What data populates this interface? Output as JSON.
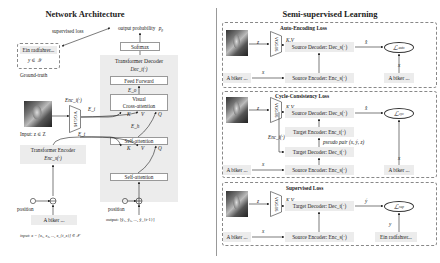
{
  "left_panel": {
    "title": "Network Architecture",
    "supervised_loss": "supervised loss",
    "output_probability": "output probability",
    "output_probability_symbol": "p_θ",
    "ground_truth_box": {
      "text": "Ein radfahrer...",
      "symbol": "y ∈ 𝒴",
      "caption": "Ground-truth"
    },
    "transformer_decoder": {
      "title": "Transformer Decoder",
      "fn": "Dec_t(·)",
      "softmax": "Softmax",
      "feed_forward": "Feed Forward",
      "visual_cross_attention_line1": "Visual",
      "visual_cross_attention_line2": "Cross-attention",
      "self_attention_1": "Self-attention",
      "self_attention_2": "Self-attention",
      "E_o": "E_o",
      "E_h": "E_h",
      "K": "K",
      "V": "V",
      "Q": "Q"
    },
    "image_encoder": {
      "fn": "Enc_i(·)",
      "label": "VGG16",
      "E_i": "E_i"
    },
    "input_image_caption": "Input:  z ∈ Z",
    "E_t": "E_t",
    "transformer_encoder": {
      "title": "Transformer Encoder",
      "fn": "Enc_s(·)"
    },
    "position_left": "position",
    "position_right": "position",
    "input_text_box": "A biker ...",
    "input_formula": "input:   x = [x₁, x₂, ..., x_{t_x}] ∈ 𝒳",
    "output_formula": "output:  [ỹ₁, ỹ₂, ..., ỹ_{t-1}]"
  },
  "right_panel": {
    "title": "Semi-supervised Learning",
    "sections": [
      {
        "title": "Auto-Encoding Loss",
        "vgg": "VGG16",
        "z": "z",
        "kv": "K,V",
        "decoder": "Source Decoder: Dec_s(·)",
        "encoder": "Source Encoder: Enc_s(·)",
        "x_hat": "x̂",
        "x_left": "x",
        "x_right": "x",
        "text_left": "A biker ...",
        "text_right": "A biker ...",
        "loss": "ℒ",
        "loss_sub": "auto"
      },
      {
        "title": "Cycle-Consistency Loss",
        "vgg": "VGG16",
        "z": "z",
        "kv": "K,V",
        "enc_i": "Enc_i(·)",
        "source_decoder": "Source Decoder: Dec_s(·)",
        "target_encoder": "Target Encoder: Enc_t(·)",
        "pseudo_pair": "pseudo pair (x, ỹ, z)",
        "target_decoder": "Target Decoder: Dec_t(·)",
        "source_encoder": "Source Encoder: Enc_s(·)",
        "x_hat": "x̂",
        "x_left": "x",
        "x_right": "x",
        "text_left": "A biker ...",
        "text_right": "A biker ...",
        "loss": "ℒ",
        "loss_sub": "cyc"
      },
      {
        "title": "Supervised Loss",
        "vgg": "VGG16",
        "z": "z",
        "kv": "K,V",
        "decoder": "Target Decoder: Dec_t(·)",
        "encoder": "Source Encoder: Enc_s(·)",
        "y_hat": "ỹ",
        "x_left": "x",
        "y_right": "y",
        "text_left": "A biker ...",
        "text_right": "Ein radfahrer...",
        "loss": "ℒ",
        "loss_sub": "sup"
      }
    ]
  }
}
